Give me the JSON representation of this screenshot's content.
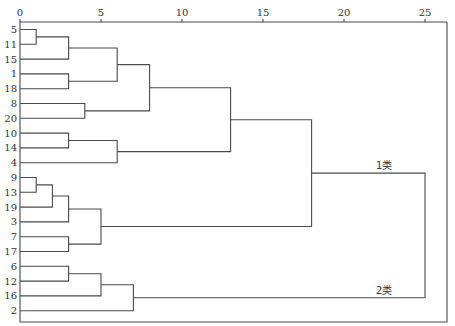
{
  "chart_data": {
    "type": "dendrogram",
    "title": "",
    "xlabel": "",
    "ylabel": "",
    "x_ticks": [
      0,
      5,
      10,
      15,
      20,
      25
    ],
    "xlim": [
      0,
      25
    ],
    "axis_position": "top",
    "leaf_order": [
      "5",
      "11",
      "15",
      "1",
      "18",
      "8",
      "20",
      "10",
      "14",
      "4",
      "9",
      "13",
      "19",
      "3",
      "7",
      "17",
      "6",
      "12",
      "16",
      "2"
    ],
    "merges": [
      {
        "id": "A1",
        "children": [
          "5",
          "11"
        ],
        "distance": 1
      },
      {
        "id": "A2",
        "children": [
          "A1",
          "15"
        ],
        "distance": 3
      },
      {
        "id": "A3",
        "children": [
          "1",
          "18"
        ],
        "distance": 3
      },
      {
        "id": "A4",
        "children": [
          "A2",
          "A3"
        ],
        "distance": 6
      },
      {
        "id": "A5",
        "children": [
          "8",
          "20"
        ],
        "distance": 4
      },
      {
        "id": "A6",
        "children": [
          "A4",
          "A5"
        ],
        "distance": 8
      },
      {
        "id": "A7",
        "children": [
          "10",
          "14"
        ],
        "distance": 3
      },
      {
        "id": "A8",
        "children": [
          "A7",
          "4"
        ],
        "distance": 6
      },
      {
        "id": "A9",
        "children": [
          "A6",
          "A8"
        ],
        "distance": 13
      },
      {
        "id": "B1",
        "children": [
          "9",
          "13"
        ],
        "distance": 1
      },
      {
        "id": "B2",
        "children": [
          "B1",
          "19"
        ],
        "distance": 2
      },
      {
        "id": "B3",
        "children": [
          "B2",
          "3"
        ],
        "distance": 3
      },
      {
        "id": "B4",
        "children": [
          "7",
          "17"
        ],
        "distance": 3
      },
      {
        "id": "B5",
        "children": [
          "B3",
          "B4"
        ],
        "distance": 5
      },
      {
        "id": "C1",
        "children": [
          "A9",
          "B5"
        ],
        "distance": 18
      },
      {
        "id": "D1",
        "children": [
          "6",
          "12"
        ],
        "distance": 3
      },
      {
        "id": "D2",
        "children": [
          "D1",
          "16"
        ],
        "distance": 5
      },
      {
        "id": "D3",
        "children": [
          "D2",
          "2"
        ],
        "distance": 7
      },
      {
        "id": "ROOT",
        "children": [
          "C1",
          "D3"
        ],
        "distance": 25
      }
    ],
    "annotations": [
      {
        "text": "1类",
        "cluster": "C1"
      },
      {
        "text": "2类",
        "cluster": "D3"
      }
    ],
    "grid": false,
    "legend": null
  },
  "labels": {
    "class1": "1类",
    "class2": "2类"
  }
}
